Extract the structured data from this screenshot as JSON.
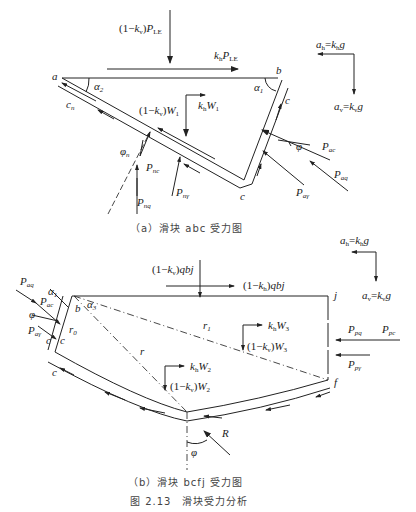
{
  "figure": {
    "number_caption": "图 2.13　滑块受力分析",
    "subfigure_a": {
      "caption": "（a）滑块 abc 受力图",
      "points": [
        "a",
        "b",
        "c"
      ],
      "labels": {
        "top_load": "(1−kv)PLE",
        "horizontal_load": "khPLE",
        "weight_vertical": "(1−kv)W1",
        "weight_horizontal": "khW1",
        "alpha1": "α1",
        "alpha2": "α2",
        "cohesion_n": "cn",
        "cohesion_c": "c",
        "phi_n": "φn",
        "phi": "φ",
        "P_nc": "Pnc",
        "P_nq": "Pnq",
        "P_ngamma": "Pnγ",
        "P_ac": "Pac",
        "P_aq": "Paq",
        "P_agamma": "Paγ"
      },
      "acceleration_legend": {
        "ah": "ah=khg",
        "av": "av=kvg"
      }
    },
    "subfigure_b": {
      "caption": "（b）滑块 bcfj 受力图",
      "points": [
        "b",
        "c",
        "f",
        "j"
      ],
      "labels": {
        "top_load": "(1−kv)qbj",
        "horizontal_load": "(1−kh)qbj",
        "weight3_horizontal": "khW3",
        "weight3_vertical": "(1−kv)W3",
        "weight2_horizontal": "khW2",
        "weight2_vertical": "(1−kv)W2",
        "alpha1": "α1",
        "alpha3": "α3",
        "r0": "r0",
        "r1": "r1",
        "r": "r",
        "R": "R",
        "phi": "φ",
        "c_left": "c",
        "c_left2": "c",
        "c_bottom": "c",
        "P_aq": "Paq",
        "P_ac": "Pac",
        "P_agamma": "Paγ",
        "P_pq": "Ppq",
        "P_pc": "Ppc",
        "P_pgamma": "Ppγ"
      },
      "acceleration_legend": {
        "ah": "ah=khg",
        "av": "av=kvg"
      }
    }
  }
}
